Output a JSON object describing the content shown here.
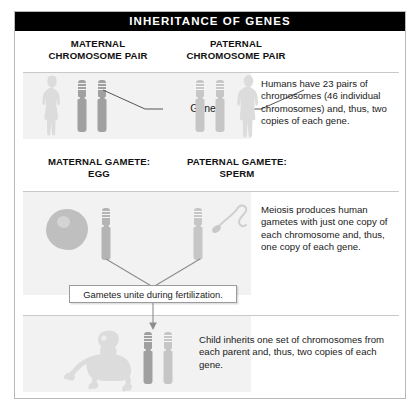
{
  "figure": {
    "title": "INHERITANCE OF GENES",
    "accent_color": "#000000",
    "frame_border_color": "#b9b9b9",
    "panel_shade_color": "#f2f2f2",
    "chromosome_dark_color": "#9a9a9a",
    "chromosome_light_color": "#c9c9c9",
    "silhouette_color": "#dcdcdc"
  },
  "section_one": {
    "maternal_header": "MATERNAL\nCHROMOSOME PAIR",
    "paternal_header": "PATERNAL\nCHROMOSOME PAIR",
    "gene_label": "Gene",
    "caption": "Humans have 23 pairs of chromosomes (46 individual chromosomes) and, thus, two copies of each gene."
  },
  "section_two": {
    "maternal_gamete_header": "MATERNAL GAMETE:\nEGG",
    "paternal_gamete_header": "PATERNAL GAMETE:\nSPERM",
    "caption": "Meiosis produces human gametes with just one copy of each chromosome and, thus, one copy of each gene.",
    "fertilization_caption": "Gametes unite during fertilization."
  },
  "section_three": {
    "caption": "Child inherits one set of chromosomes from each parent and, thus, two copies of each gene."
  }
}
